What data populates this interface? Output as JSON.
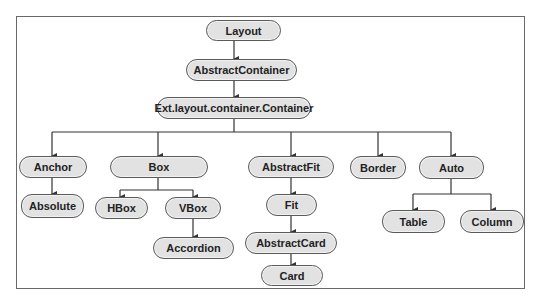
{
  "diagram": {
    "type": "class-hierarchy",
    "colors": {
      "node_fill": "#e2e2e2",
      "node_border": "#5a5a5a",
      "edge": "#333333",
      "frame": "#6a6a6a"
    },
    "nodes": {
      "layout": {
        "label": "Layout"
      },
      "abstract_container": {
        "label": "AbstractContainer"
      },
      "container": {
        "label": "Ext.layout.container.Container"
      },
      "anchor": {
        "label": "Anchor"
      },
      "absolute": {
        "label": "Absolute"
      },
      "box": {
        "label": "Box"
      },
      "hbox": {
        "label": "HBox"
      },
      "vbox": {
        "label": "VBox"
      },
      "accordion": {
        "label": "Accordion"
      },
      "abstract_fit": {
        "label": "AbstractFit"
      },
      "fit": {
        "label": "Fit"
      },
      "abstract_card": {
        "label": "AbstractCard"
      },
      "card": {
        "label": "Card"
      },
      "border": {
        "label": "Border"
      },
      "auto": {
        "label": "Auto"
      },
      "table": {
        "label": "Table"
      },
      "column": {
        "label": "Column"
      }
    },
    "edges": [
      [
        "Layout",
        "AbstractContainer"
      ],
      [
        "AbstractContainer",
        "Ext.layout.container.Container"
      ],
      [
        "Ext.layout.container.Container",
        "Anchor"
      ],
      [
        "Ext.layout.container.Container",
        "Box"
      ],
      [
        "Ext.layout.container.Container",
        "AbstractFit"
      ],
      [
        "Ext.layout.container.Container",
        "Border"
      ],
      [
        "Ext.layout.container.Container",
        "Auto"
      ],
      [
        "Anchor",
        "Absolute"
      ],
      [
        "Box",
        "HBox"
      ],
      [
        "Box",
        "VBox"
      ],
      [
        "VBox",
        "Accordion"
      ],
      [
        "AbstractFit",
        "Fit"
      ],
      [
        "Fit",
        "AbstractCard"
      ],
      [
        "AbstractCard",
        "Card"
      ],
      [
        "Auto",
        "Table"
      ],
      [
        "Auto",
        "Column"
      ]
    ]
  }
}
